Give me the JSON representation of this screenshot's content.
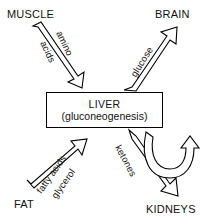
{
  "diagram": {
    "stroke_color": "#000000",
    "fill_color": "#ffffff",
    "text_color": "#111111"
  },
  "nodes": {
    "muscle": "MUSCLE",
    "brain": "BRAIN",
    "fat": "FAT",
    "kidneys": "KIDNEYS",
    "liver_title": "LIVER",
    "liver_subtitle": "(gluconeogenesis)"
  },
  "edges": {
    "amino_line1": "amino",
    "amino_line2": "acids",
    "glucose": "glucose",
    "fatty_line1": "fatty acids",
    "fatty_line2": "glycerol",
    "ketones": "ketones"
  },
  "icons": {
    "arrow_muscle_to_liver": "block-arrow-down-right-icon",
    "arrow_liver_to_brain": "block-arrow-up-right-icon",
    "arrow_fat_to_liver": "block-arrow-up-right-icon",
    "arrow_liver_to_kidneys": "block-arrow-down-right-icon",
    "arrow_kidneys_recycle": "curved-hook-arrow-up-icon"
  }
}
